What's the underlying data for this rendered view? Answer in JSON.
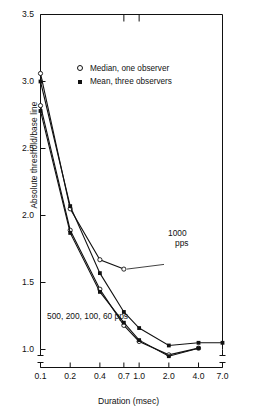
{
  "chart_data": {
    "type": "line",
    "title": "",
    "xlabel": "Duration (msec)",
    "ylabel": "Absolute threshold/base line",
    "xscale": "log",
    "xlim": [
      0.1,
      7.0
    ],
    "ylim": [
      1.0,
      3.5
    ],
    "xticks": [
      "0.1",
      "0.2",
      "0.4",
      "0.7",
      "1.0",
      "2.0",
      "4.0",
      "7.0"
    ],
    "xtick_values": [
      0.1,
      0.2,
      0.4,
      0.7,
      1.0,
      2.0,
      4.0,
      7.0
    ],
    "yticks": [
      "1.0",
      "1.5",
      "2.0",
      "2.5",
      "3.0",
      "3.5"
    ],
    "ytick_values": [
      1.0,
      1.5,
      2.0,
      2.5,
      3.0,
      3.5
    ],
    "grid": false,
    "axis_break_x": true,
    "axis_break_y": true,
    "legend_position": "upper-center",
    "legend": [
      {
        "marker": "open-circle",
        "label": "Median, one observer"
      },
      {
        "marker": "filled-square",
        "label": "Mean, three observers"
      }
    ],
    "annotations": [
      {
        "text_line1": "1000",
        "text_line2": "pps",
        "x": 1.15,
        "y": 1.62
      },
      {
        "text": "500, 200, 100, 60 pps",
        "x": 0.145,
        "y": 1.07
      }
    ],
    "series": [
      {
        "name": "1000 pps, median, one observer",
        "marker": "open-circle",
        "x": [
          0.1,
          0.2,
          0.4,
          0.7
        ],
        "values": [
          3.06,
          2.05,
          1.67,
          1.6
        ]
      },
      {
        "name": "1000 pps, mean, three observers",
        "marker": "filled-square",
        "x": [
          0.1,
          0.2,
          0.4,
          0.7,
          1.0,
          2.0,
          4.0,
          7.0
        ],
        "values": [
          3.0,
          2.07,
          1.57,
          1.28,
          1.16,
          1.03,
          1.05,
          1.05
        ]
      },
      {
        "name": "500, 200, 100, 60 pps, median, one observer",
        "marker": "open-circle",
        "x": [
          0.1,
          0.2,
          0.4,
          0.7,
          1.0,
          2.0,
          4.0
        ],
        "values": [
          2.82,
          1.89,
          1.45,
          1.18,
          1.06,
          0.96,
          1.01
        ]
      },
      {
        "name": "500, 200, 100, 60 pps, mean, three observers",
        "marker": "filled-square",
        "x": [
          0.1,
          0.2,
          0.4,
          0.7,
          1.0,
          2.0,
          4.0
        ],
        "values": [
          2.78,
          1.87,
          1.43,
          1.2,
          1.07,
          0.95,
          1.01
        ]
      }
    ]
  },
  "axes": {
    "y_title": "Absolute threshold/base line",
    "x_title": "Duration (msec)"
  }
}
